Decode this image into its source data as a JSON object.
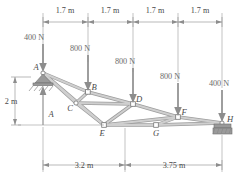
{
  "figure": {
    "units": "m / N",
    "colors": {
      "member": "#9d9d9d",
      "member_fill": "#cfcfcf",
      "dimension": "#8a8a8a",
      "load": "#8d8d8d",
      "text": "#4a4a4a",
      "background": "#ffffff"
    }
  },
  "top_dimensions": {
    "segments": [
      {
        "label": "1.7 m"
      },
      {
        "label": "1.7 m"
      },
      {
        "label": "1.7 m"
      },
      {
        "label": "1.7 m"
      }
    ]
  },
  "bottom_dimensions": {
    "segments": [
      {
        "label": "3.2 m"
      },
      {
        "label": "3.75 m"
      }
    ]
  },
  "vertical_dimension": {
    "label": "2 m"
  },
  "loads": [
    {
      "id": "load-a",
      "label": "400 N",
      "at_joint": "A"
    },
    {
      "id": "load-b",
      "label": "800 N",
      "at_joint": "B"
    },
    {
      "id": "load-d",
      "label": "800 N",
      "at_joint": "D"
    },
    {
      "id": "load-f",
      "label": "800 N",
      "at_joint": "F"
    },
    {
      "id": "load-h",
      "label": "400 N",
      "at_joint": "H"
    }
  ],
  "joints": [
    {
      "id": "A",
      "label": "A"
    },
    {
      "id": "B",
      "label": "B"
    },
    {
      "id": "C",
      "label": "C"
    },
    {
      "id": "D",
      "label": "D"
    },
    {
      "id": "E",
      "label": "E"
    },
    {
      "id": "F",
      "label": "F"
    },
    {
      "id": "G",
      "label": "G"
    },
    {
      "id": "H",
      "label": "H"
    }
  ],
  "reaction": {
    "label": "A"
  },
  "supports": [
    {
      "id": "support-a",
      "type": "pin",
      "at_joint": "A"
    },
    {
      "id": "support-h",
      "type": "roller",
      "at_joint": "H"
    }
  ]
}
